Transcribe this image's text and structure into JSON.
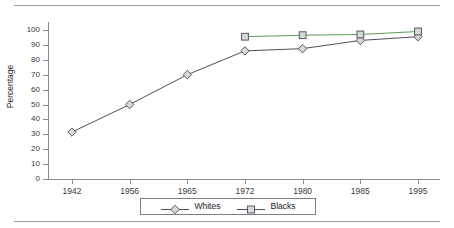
{
  "page": {
    "rules": [
      "top-rule",
      "bottom-rule"
    ]
  },
  "chart_data": {
    "type": "line",
    "title": "",
    "subtitle": "",
    "xlabel": "",
    "ylabel": "Percentage",
    "categories": [
      "1942",
      "1956",
      "1965",
      "1972",
      "1980",
      "1985",
      "1995"
    ],
    "x": [
      1942,
      1956,
      1965,
      1972,
      1980,
      1985,
      1995
    ],
    "ylim": [
      0,
      100
    ],
    "yticks": [
      0,
      10,
      20,
      30,
      40,
      50,
      60,
      70,
      80,
      90,
      100
    ],
    "ytick_labels": [
      "0",
      "10",
      "20",
      "30",
      "40",
      "50",
      "60",
      "70",
      "80",
      "90",
      "100"
    ],
    "grid": false,
    "legend_position": "bottom",
    "series": [
      {
        "name": "Whites",
        "marker": "diamond",
        "color": "#3b3b4a",
        "values": [
          31.5,
          50,
          70,
          86,
          87.5,
          93,
          95.5
        ]
      },
      {
        "name": "Blacks",
        "marker": "square",
        "color": "#3b3b4a",
        "values": [
          null,
          null,
          null,
          95.5,
          96.5,
          97,
          99
        ]
      }
    ]
  },
  "legend": {
    "entries": [
      {
        "label": "Whites",
        "marker": "diamond"
      },
      {
        "label": "Blacks",
        "marker": "square"
      }
    ]
  },
  "colors": {
    "axis": "#8b8b93",
    "line_whites": "#3b3b4a",
    "line_blacks": "#4a8f4a",
    "marker_fill": "#d8d8d8",
    "marker_stroke": "#4a4a52",
    "text": "#2b2b2b",
    "rule": "#9a9aa2"
  }
}
